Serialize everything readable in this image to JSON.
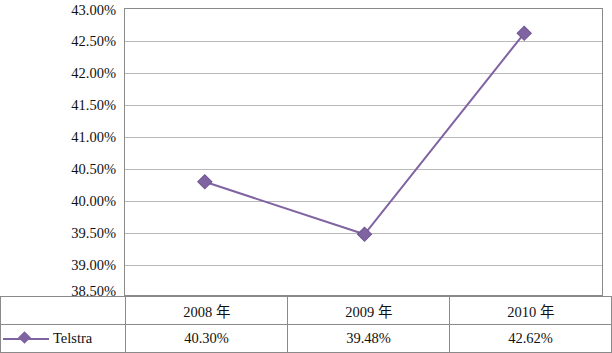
{
  "chart_data": {
    "type": "line",
    "title": "",
    "xlabel": "",
    "ylabel": "",
    "categories": [
      "2008 年",
      "2009 年",
      "2010 年"
    ],
    "series": [
      {
        "name": "Telstra",
        "values": [
          40.3,
          39.48,
          42.62
        ],
        "labels": [
          "40.30%",
          "39.48%",
          "42.62%"
        ],
        "color": "#8064a2",
        "marker": "diamond"
      }
    ],
    "ylim": [
      38.5,
      43.0
    ],
    "ytick_labels": [
      "43.00%",
      "42.50%",
      "42.00%",
      "41.50%",
      "41.00%",
      "40.50%",
      "40.00%",
      "39.50%",
      "39.00%",
      "38.50%"
    ],
    "ytick_values": [
      43.0,
      42.5,
      42.0,
      41.5,
      41.0,
      40.5,
      40.0,
      39.5,
      39.0,
      38.5
    ],
    "grid": true,
    "legend_position": "table-row-header"
  },
  "table": {
    "header_row": [
      "",
      "2008 年",
      "2009 年",
      "2010 年"
    ],
    "data_row": [
      "Telstra",
      "40.30%",
      "39.48%",
      "42.62%"
    ]
  }
}
